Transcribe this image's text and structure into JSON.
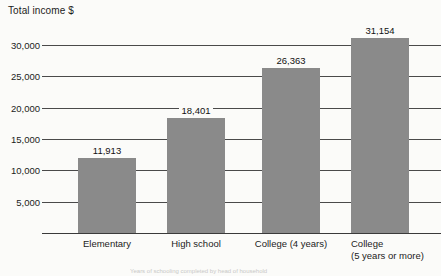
{
  "chart_data": {
    "type": "bar",
    "title": "Total income $",
    "xlabel": "",
    "ylabel": "Total income $",
    "categories": [
      "Elementary",
      "High school",
      "College (4 years)",
      "College\n(5 years or more)"
    ],
    "values": [
      11913,
      18401,
      26363,
      31154
    ],
    "value_labels": [
      "11,913",
      "18,401",
      "26,363",
      "31,154"
    ],
    "ytick_labels": [
      "30,000",
      "25,000",
      "20,000",
      "15,000",
      "10,000",
      "5,000"
    ],
    "ytick_values": [
      30000,
      25000,
      20000,
      15000,
      10000,
      5000
    ],
    "ylim": [
      0,
      32500
    ],
    "grid": true,
    "legend": "none",
    "bar_color": "#8a8a8a",
    "axis_color": "#4a4a4a",
    "background": "#fbfbf9"
  },
  "footnote": {
    "text": "Years of schooling completed by head of household"
  }
}
